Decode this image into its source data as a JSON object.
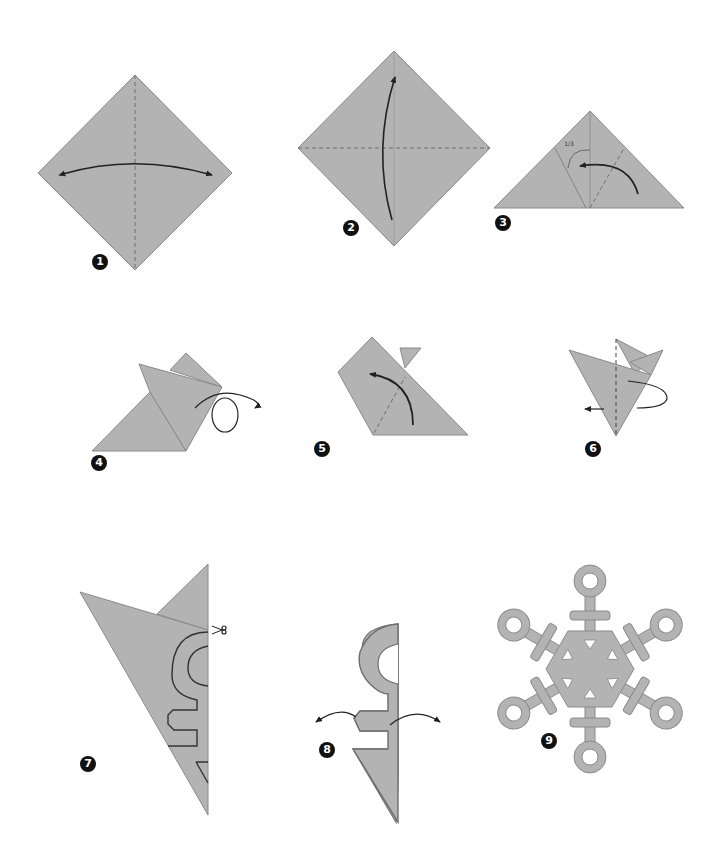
{
  "colors": {
    "paper": "#b3b3b3",
    "paper_edge": "#8a8a8a",
    "line": "#222222",
    "crease": "#6e6e6e",
    "badge": "#111111",
    "background": "#ffffff"
  },
  "steps": [
    {
      "number": "1",
      "description": "Square diamond with vertical dashed crease; double-headed horizontal arrow (fold in half and unfold)"
    },
    {
      "number": "2",
      "description": "Square diamond with horizontal dashed crease; arrow from bottom up to top corner (fold bottom corner up)"
    },
    {
      "number": "3",
      "description": "Triangle with marked one-third angle; curved arrow folding right side to the left along dashed line",
      "label": "1/3"
    },
    {
      "number": "4",
      "description": "Folded shape with loop arrow indicating fold behind"
    },
    {
      "number": "5",
      "description": "Folded shape with dashed line and curved arrow folding upward-left"
    },
    {
      "number": "6",
      "description": "Cone shape with dashed center line and wrap-around arrow (fold in half behind)"
    },
    {
      "number": "7",
      "description": "Folded wedge with cut-pattern outline and scissors icon"
    },
    {
      "number": "8",
      "description": "Cut-out shape with arrows pointing outward (unfold)"
    },
    {
      "number": "9",
      "description": "Finished six-armed snowflake with rings, crossbars and triangle cut-outs"
    }
  ],
  "annotations": {
    "step3_fraction": "1/3",
    "scissors": "cut-here"
  }
}
